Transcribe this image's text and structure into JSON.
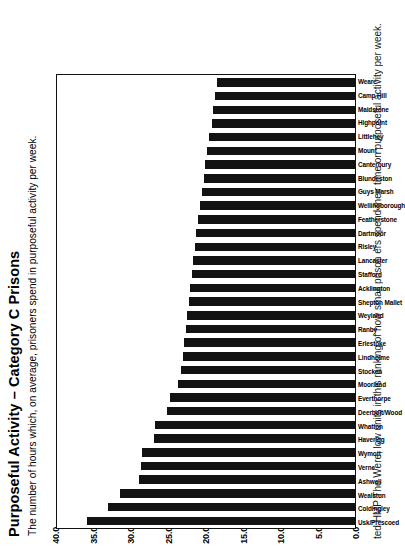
{
  "title": "Purposeful Activity – Category C Prisons",
  "subtitle": "The number of hours which, on average, prisoners spend in purposeful activity per week.",
  "footer": "ted HMP The Were, low units in this ranking of how small prison ers spend their time on purposeful activity per week.",
  "chart_data": {
    "type": "bar",
    "title": "Purposeful Activity – Category C Prisons",
    "subtitle": "The number of hours which, on average, prisoners spend in purposeful activity per week.",
    "xlabel": "",
    "ylabel": "",
    "ylim": [
      0.0,
      40.0
    ],
    "yticks": [
      "0.0",
      "5.0",
      "10.0",
      "15.0",
      "20.0",
      "25.0",
      "30.0",
      "35.0",
      "40.0"
    ],
    "ytick_values": [
      0.0,
      5.0,
      10.0,
      15.0,
      20.0,
      25.0,
      30.0,
      35.0,
      40.0
    ],
    "grid": false,
    "legend": null,
    "bar_color": "#121212",
    "orientation": "vertical",
    "categories": [
      "Usk/Prescoed",
      "Coldingley",
      "Wealstun",
      "Ashwell",
      "Verne",
      "Wymott",
      "Haverigg",
      "Whatton",
      "Deerbolt/Wood",
      "Everthorpe",
      "Moorland",
      "Stocken",
      "Lindholme",
      "Erlestoke",
      "Ranby",
      "Weyland",
      "Shepton Mallet",
      "Acklington",
      "Stafford",
      "Lancaster",
      "Risley",
      "Dartmoor",
      "Featherstone",
      "Wellingborough",
      "Guys Marsh",
      "Blundeston",
      "Canterbury",
      "Mount",
      "Littlehey",
      "Highpoint",
      "Maidstone",
      "Camp Hill",
      "Weare"
    ],
    "values": [
      36.0,
      33.2,
      31.6,
      29.0,
      28.8,
      28.6,
      27.0,
      26.8,
      25.2,
      24.8,
      23.8,
      23.3,
      23.1,
      22.9,
      22.7,
      22.5,
      22.3,
      22.1,
      21.9,
      21.7,
      21.5,
      21.3,
      21.1,
      20.8,
      20.6,
      20.3,
      20.1,
      19.9,
      19.6,
      19.2,
      19.0,
      18.8,
      18.5
    ]
  }
}
